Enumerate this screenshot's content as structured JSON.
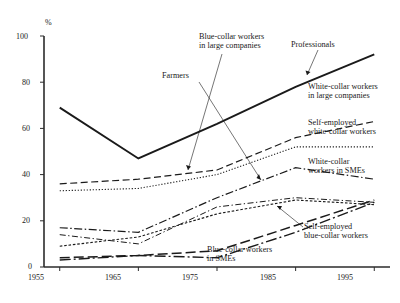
{
  "chart_data": {
    "type": "line",
    "title": "",
    "xlabel": "",
    "ylabel": "%",
    "unit_label": "%",
    "x": [
      1955,
      1965,
      1975,
      1985,
      1995
    ],
    "xlim": [
      1953,
      1997
    ],
    "ylim": [
      0,
      100
    ],
    "yticks": [
      0,
      20,
      40,
      60,
      80,
      100
    ],
    "xticks": [
      1955,
      1965,
      1975,
      1985,
      1995
    ],
    "xtick_labels": [
      "1955",
      "1965",
      "1975",
      "1985",
      "1995"
    ],
    "ytick_labels": [
      "0",
      "20",
      "40",
      "60",
      "80",
      "100"
    ],
    "grid": false,
    "legend_position": "inline-annotations",
    "series": [
      {
        "name": "Professionals",
        "style": "solid-thick",
        "values": [
          69,
          47,
          62,
          78,
          92
        ]
      },
      {
        "name": "White-collar workers in large companies",
        "style": "dashed",
        "values": [
          36,
          38,
          42,
          56,
          63
        ]
      },
      {
        "name": "Self-employed white-collar workers",
        "style": "dotted",
        "values": [
          33,
          34,
          40,
          52,
          52
        ]
      },
      {
        "name": "White-collar workers in SMEs",
        "style": "dash-dot",
        "values": [
          17,
          15,
          30,
          43,
          38
        ]
      },
      {
        "name": "Blue-collar workers in large companies",
        "style": "dash-dot-thin",
        "values": [
          14,
          10,
          26,
          30,
          28
        ]
      },
      {
        "name": "Self-employed blue-collar workers",
        "style": "dotted-fine",
        "values": [
          9,
          13,
          23,
          29,
          27
        ]
      },
      {
        "name": "Blue-collar workers in SMEs",
        "style": "long-dash",
        "values": [
          4,
          5,
          7,
          18,
          29
        ]
      },
      {
        "name": "Farmers",
        "style": "long-dash-dot",
        "values": [
          3,
          5,
          4,
          15,
          28
        ]
      }
    ],
    "annotations": [
      {
        "id": "ann-professionals",
        "text": "Professionals",
        "leader": true
      },
      {
        "id": "ann-blue-collar-large",
        "text": "Blue-collar workers\nin large companies",
        "leader": true
      },
      {
        "id": "ann-farmers",
        "text": "Farmers",
        "leader": true
      },
      {
        "id": "ann-white-collar-large",
        "text": "White-collar workers\nin large companies",
        "leader": false
      },
      {
        "id": "ann-self-employed-white",
        "text": "Self-employed\nwhite-collar workers",
        "leader": false
      },
      {
        "id": "ann-white-collar-smes",
        "text": "White-collar\nworkers in SMEs",
        "leader": false
      },
      {
        "id": "ann-self-employed-blue",
        "text": "Self-employed\nblue-collar workers",
        "leader": true
      },
      {
        "id": "ann-blue-collar-smes",
        "text": "Blue-collar workers\nin SMEs",
        "leader": false
      }
    ],
    "colors": {
      "axis": "#2b2b2b",
      "line": "#1a1a1a",
      "background": "#ffffff"
    }
  },
  "labels": {
    "unit": "%",
    "professionals": "Professionals",
    "blue_collar_large": "Blue-collar workers\nin large companies",
    "farmers": "Farmers",
    "white_collar_large": "White-collar workers\nin large companies",
    "self_employed_white": "Self-employed\nwhite-collar workers",
    "white_collar_smes": "White-collar\nworkers in SMEs",
    "self_employed_blue": "Self-employed\nblue-collar workers",
    "blue_collar_smes": "Blue-collar workers\nin SMEs"
  },
  "axis": {
    "y_0": "0",
    "y_20": "20",
    "y_40": "40",
    "y_60": "60",
    "y_80": "80",
    "y_100": "100",
    "x_1955": "1955",
    "x_1965": "1965",
    "x_1975": "1975",
    "x_1985": "1985",
    "x_1995": "1995"
  }
}
